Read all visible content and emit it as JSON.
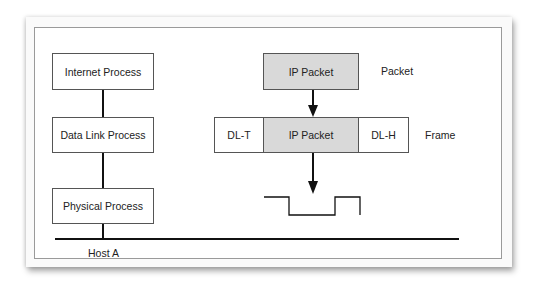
{
  "diagram": {
    "host_stack": {
      "layers": [
        {
          "label": "Internet Process"
        },
        {
          "label": "Data Link Process"
        },
        {
          "label": "Physical Process"
        }
      ],
      "host_label": "Host A"
    },
    "encapsulation": {
      "packet": {
        "content": "IP Packet",
        "label": "Packet"
      },
      "frame": {
        "trailer": "DL-T",
        "payload": "IP Packet",
        "header": "DL-H",
        "label": "Frame"
      },
      "signal": "square-wave"
    },
    "colors": {
      "packet_fill": "#d9d9d9",
      "line": "#111111",
      "border": "#555555"
    }
  }
}
